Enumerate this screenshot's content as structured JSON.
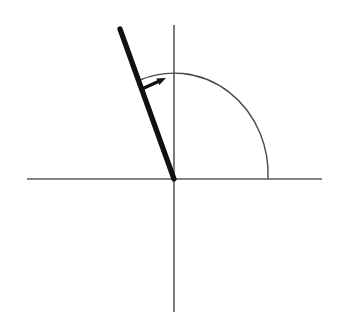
{
  "figure": {
    "title": "Standard position angle with terminal ray in the second quadrant",
    "width": 342,
    "height": 322,
    "background_color": "#ffffff"
  },
  "chart_data": {
    "type": "scatter",
    "title": "",
    "xlabel": "",
    "ylabel": "",
    "grid": false,
    "legend": null,
    "axis_style": {
      "color": "#5a5a5a",
      "stroke_width": 1.6
    },
    "origin": {
      "x": 174,
      "y": 179
    },
    "axes": [
      {
        "name": "x-axis",
        "orientation": "horizontal",
        "x1": 27,
        "y1": 179,
        "x2": 322,
        "y2": 179
      },
      {
        "name": "y-axis",
        "orientation": "vertical",
        "x1": 174,
        "y1": 25,
        "x2": 174,
        "y2": 312
      }
    ],
    "terminal_ray": {
      "name": "terminal-side",
      "color": "#111111",
      "stroke_width": 5.2,
      "x1": 174,
      "y1": 179,
      "x2": 120,
      "y2": 29,
      "angle_degrees": 110,
      "quadrant": 2
    },
    "angle_arc": {
      "name": "angle-arc",
      "color": "#4a4a4a",
      "stroke_width": 1.4,
      "center_x": 174,
      "center_y": 179,
      "radius_x": 94,
      "radius_y": 101,
      "start_x": 268,
      "start_y": 179,
      "end_x": 140,
      "end_y": 80,
      "sweep": "counterclockwise",
      "sweep_degrees": 110
    },
    "direction_arrow": {
      "name": "rotation-direction-arrow",
      "color": "#111111",
      "stroke_width": 3.2,
      "tail_x": 144,
      "tail_y": 88,
      "tip_x": 166,
      "tip_y": 78,
      "points_toward": "arc"
    }
  }
}
